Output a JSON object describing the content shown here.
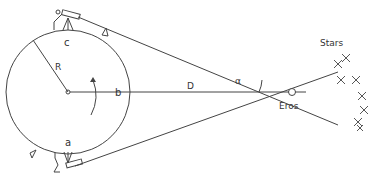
{
  "diagram": {
    "labels": {
      "point_c": "c",
      "point_a": "a",
      "point_b": "b",
      "radius": "R",
      "distance": "D",
      "angle": "α",
      "target": "Eros",
      "background": "Stars"
    },
    "elements": {
      "earth": {
        "shape": "circle",
        "center": [
          68,
          92
        ],
        "radius": 62
      },
      "eros": {
        "shape": "small-circle",
        "center": [
          292,
          92
        ]
      },
      "observers": [
        "telescope-top",
        "telescope-bottom"
      ],
      "rotation_arrow": "counterclockwise",
      "stars_count": 8
    },
    "colors": {
      "line": "#444444",
      "text": "#333333",
      "background": "#ffffff"
    }
  }
}
